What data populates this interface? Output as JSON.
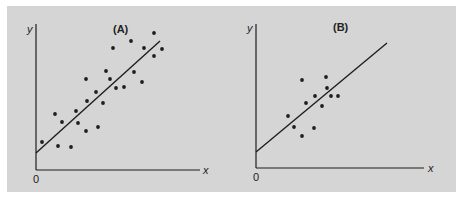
{
  "figure": {
    "background": "#d5d5d5",
    "ink": "#1e1e1e"
  },
  "chart_data": [
    {
      "type": "scatter",
      "title": "(A)",
      "xlabel": "x",
      "ylabel": "y",
      "origin_label": "0",
      "grid": false,
      "fit_line": {
        "from": [
          0,
          17
        ],
        "to": [
          124,
          129
        ]
      },
      "note": "Coordinates in pixel units relative to axes origin (x right, y up); large sample with strong positive linear trend",
      "points": [
        [
          6,
          28
        ],
        [
          19,
          56
        ],
        [
          22,
          24
        ],
        [
          26,
          48
        ],
        [
          35,
          23
        ],
        [
          40,
          59
        ],
        [
          42,
          47
        ],
        [
          50,
          91
        ],
        [
          51,
          69
        ],
        [
          50,
          39
        ],
        [
          60,
          78
        ],
        [
          62,
          43
        ],
        [
          67,
          67
        ],
        [
          70,
          99
        ],
        [
          74,
          91
        ],
        [
          77,
          122
        ],
        [
          80,
          82
        ],
        [
          88,
          83
        ],
        [
          95,
          129
        ],
        [
          98,
          98
        ],
        [
          106,
          88
        ],
        [
          108,
          122
        ],
        [
          118,
          137
        ],
        [
          118,
          114
        ],
        [
          126,
          121
        ]
      ]
    },
    {
      "type": "scatter",
      "title": "(B)",
      "xlabel": "x",
      "ylabel": "y",
      "origin_label": "0",
      "grid": false,
      "fit_line": {
        "from": [
          0,
          16
        ],
        "to": [
          131,
          125
        ]
      },
      "note": "Coordinates in pixel units relative to axes origin (x right, y up); small sample with positive linear trend",
      "points": [
        [
          32,
          52
        ],
        [
          38,
          41
        ],
        [
          46,
          88
        ],
        [
          46,
          32
        ],
        [
          50,
          65
        ],
        [
          59,
          72
        ],
        [
          58,
          40
        ],
        [
          66,
          62
        ],
        [
          70,
          91
        ],
        [
          71,
          80
        ],
        [
          75,
          72
        ],
        [
          82,
          72
        ]
      ]
    }
  ]
}
